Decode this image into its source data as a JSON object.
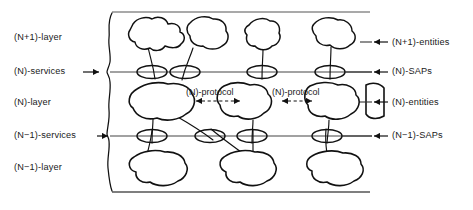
{
  "figure": {
    "type": "layered-architecture-diagram",
    "ink_color": "#111111",
    "line_color": "#4a4a4a",
    "background": "#ffffff"
  },
  "left_labels": [
    {
      "text": "(N+1)-layer",
      "x": 14,
      "y": 33,
      "has_arrow": false
    },
    {
      "text": "(N)-services",
      "x": 14,
      "y": 67,
      "has_arrow": true,
      "arrow_x": 83,
      "arrow_y": 72
    },
    {
      "text": "(N)-layer",
      "x": 14,
      "y": 98,
      "has_arrow": false
    },
    {
      "text": "(N−1)-services",
      "x": 14,
      "y": 131,
      "has_arrow": true,
      "arrow_x": 97,
      "arrow_y": 136
    },
    {
      "text": "(N−1)-layer",
      "x": 14,
      "y": 163,
      "has_arrow": false
    }
  ],
  "right_labels": [
    {
      "text": "(N+1)-entities",
      "x": 392,
      "y": 38,
      "arrow_x": 372,
      "arrow_y": 42
    },
    {
      "text": "(N)-SAPs",
      "x": 392,
      "y": 67,
      "arrow_x": 372,
      "arrow_y": 72
    },
    {
      "text": "(N)-entities",
      "x": 392,
      "y": 98,
      "arrow_x": 372,
      "arrow_y": 102
    },
    {
      "text": "(N−1)-SAPs",
      "x": 392,
      "y": 131,
      "arrow_x": 372,
      "arrow_y": 136
    }
  ],
  "protocol_labels": [
    {
      "text": "(N)-protocol",
      "x": 186,
      "y": 88,
      "arrow_x1": 196,
      "arrow_x2": 240,
      "arrow_y": 101
    },
    {
      "text": "(N)-protocol",
      "x": 272,
      "y": 88,
      "arrow_x1": 282,
      "arrow_x2": 312,
      "arrow_y": 101
    }
  ],
  "frame": {
    "top_y": 12,
    "bottom_y": 192,
    "left_x": 106,
    "right_x": 368,
    "left_edge_style": "hand-drawn wavy vertical line"
  },
  "service_lines": [
    {
      "name": "(N)-services-line",
      "y": 72,
      "x1": 110,
      "x2": 372
    },
    {
      "name": "(N-1)-services-line",
      "y": 136,
      "x1": 110,
      "x2": 372
    }
  ],
  "saps": {
    "upper_row_y": 72,
    "upper_row_x": [
      152,
      185,
      262,
      330
    ],
    "lower_row_y": 136,
    "lower_row_x": [
      152,
      210,
      252,
      327
    ],
    "rx": 15,
    "ry": 6.5
  },
  "blobs": {
    "top_layer_count": 4,
    "middle_layer_count": 4,
    "bottom_layer_count": 3
  }
}
